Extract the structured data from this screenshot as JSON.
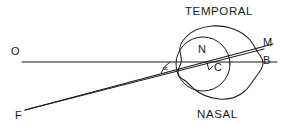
{
  "figure": {
    "background_color": "#ffffff",
    "ink_color": "#1a1a1a",
    "labels": {
      "temporal": "TEMPORAL",
      "nasal": "NASAL",
      "origin": "O",
      "fixation": "F",
      "nodal": "N",
      "center": "C",
      "macula": "M",
      "blind_spot": "B",
      "angle": "∝"
    },
    "points": {
      "O": {
        "x": 14,
        "y": 52
      },
      "F": {
        "x": 18,
        "y": 116
      },
      "N": {
        "x": 203,
        "y": 50
      },
      "C": {
        "x": 216,
        "y": 66
      },
      "M": {
        "x": 266,
        "y": 43
      },
      "B": {
        "x": 266,
        "y": 61
      }
    },
    "geometry": {
      "horizontal_axis": {
        "x1": 22,
        "y1": 62,
        "x2": 277,
        "y2": 62
      },
      "visual_axis": {
        "x1": 25,
        "y1": 110,
        "x2": 272,
        "y2": 45
      },
      "second_ray": {
        "x1": 25,
        "y1": 110,
        "x2": 266,
        "y2": 48
      },
      "globe": {
        "cx": 220,
        "cy": 62,
        "rx": 42,
        "ry": 36
      },
      "inner_circle": {
        "cx": 203,
        "cy": 64,
        "r": 27
      },
      "angle_arc_radius": 22
    }
  }
}
